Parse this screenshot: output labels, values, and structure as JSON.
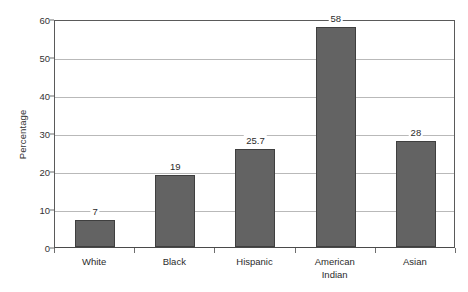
{
  "chart_data": {
    "type": "bar",
    "title": "",
    "subtitle": "",
    "xlabel": "",
    "ylabel": "Percentage",
    "categories": [
      "White",
      "Black",
      "Hispanic",
      "American\nIndian",
      "Asian"
    ],
    "values": [
      7,
      19,
      25.7,
      58,
      28
    ],
    "value_labels": [
      "7",
      "19",
      "25.7",
      "58",
      "28"
    ],
    "ylim": [
      0,
      60
    ],
    "y_ticks": [
      0,
      10,
      20,
      30,
      40,
      50,
      60
    ],
    "y_tick_labels": [
      "0",
      "10",
      "20",
      "30",
      "40",
      "50",
      "60"
    ],
    "grid": true,
    "legend": false,
    "legend_position": "none",
    "bar_color": "#636363",
    "bar_border_color": "#3f3f3f",
    "gridline_color": "#b9b9b9",
    "axis_color": "#5a5a5a",
    "background_color": "#ffffff"
  }
}
